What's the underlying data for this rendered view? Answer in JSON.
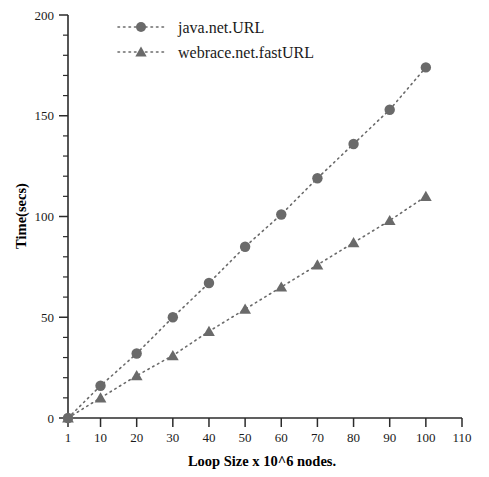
{
  "chart_data": {
    "type": "scatter",
    "title": "",
    "xlabel": "Loop Size x 10^6 nodes.",
    "ylabel": "Time(secs)",
    "xlim": [
      1,
      110
    ],
    "ylim": [
      0,
      200
    ],
    "grid": false,
    "legend_position": "top-center",
    "x_ticks": [
      "1",
      "10",
      "20",
      "30",
      "40",
      "50",
      "60",
      "70",
      "80",
      "90",
      "100",
      "110"
    ],
    "x_tick_values": [
      1,
      10,
      20,
      30,
      40,
      50,
      60,
      70,
      80,
      90,
      100,
      110
    ],
    "y_ticks": [
      "0",
      "50",
      "100",
      "150",
      "200"
    ],
    "y_tick_values": [
      0,
      50,
      100,
      150,
      200
    ],
    "y_minor_interval": 10,
    "x": [
      1,
      10,
      20,
      30,
      40,
      50,
      60,
      70,
      80,
      90,
      100
    ],
    "series": [
      {
        "name": "java.net.URL",
        "marker": "circle",
        "linestyle": "dotted",
        "color": "#6a6a6a",
        "values": [
          0,
          16,
          32,
          50,
          67,
          85,
          101,
          119,
          136,
          153,
          174
        ]
      },
      {
        "name": "webrace.net.fastURL",
        "marker": "triangle",
        "linestyle": "dotted",
        "color": "#6a6a6a",
        "values": [
          0,
          10,
          21,
          31,
          43,
          54,
          65,
          76,
          87,
          98,
          110
        ]
      }
    ]
  },
  "legend": {
    "entries": [
      {
        "label": "java.net.URL",
        "marker": "circle-marker-icon"
      },
      {
        "label": "webrace.net.fastURL",
        "marker": "triangle-marker-icon"
      }
    ]
  },
  "axes": {
    "x_title": "Loop Size x 10^6 nodes.",
    "y_title": "Time(secs)"
  },
  "colors": {
    "series": "#6a6a6a",
    "axis": "#2b2b2b",
    "text": "#1a1a1a",
    "background": "#ffffff"
  }
}
